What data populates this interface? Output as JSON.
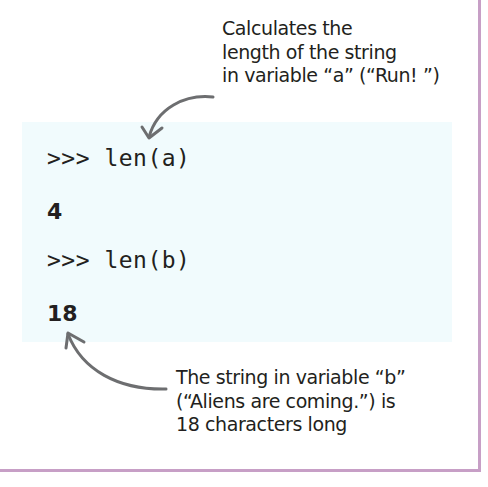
{
  "annotations": {
    "top": {
      "lines": [
        "Calculates the",
        "length of the string",
        "in variable “a” (“Run! ”)"
      ]
    },
    "bottom": {
      "lines": [
        "The string in variable “b”",
        "(“Aliens are coming.”) is",
        "18 characters long"
      ]
    }
  },
  "console": {
    "lines": [
      {
        "type": "command",
        "text": ">>> len(a)"
      },
      {
        "type": "output",
        "text": "4"
      },
      {
        "type": "command",
        "text": ">>> len(b)"
      },
      {
        "type": "output",
        "text": "18"
      }
    ]
  },
  "colors": {
    "frame_border": "#c79fc6",
    "code_background": "#f1fbfd",
    "arrow": "#6d6e70",
    "text": "#231f20"
  },
  "icons": [
    "curved-arrow-down-left",
    "curved-arrow-up-left"
  ]
}
